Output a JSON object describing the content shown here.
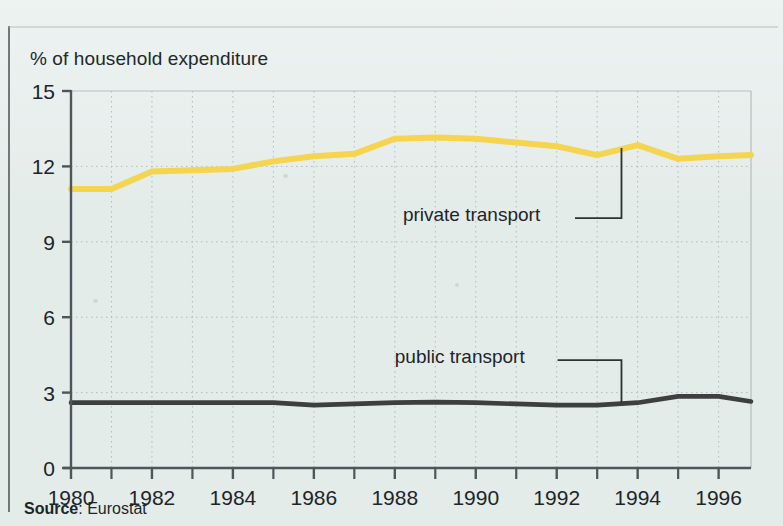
{
  "figure": {
    "axis_title": "% of household expenditure",
    "source_label": "Source",
    "source_separator": ": ",
    "source_value": "Eurostat"
  },
  "annotations": {
    "private": "private transport",
    "public": "public transport"
  },
  "colors": {
    "private_line": "#f5d44f",
    "public_line": "#3b3f40",
    "background": "#e4ecea",
    "axis": "#4d5658",
    "grid": "#aebbb9",
    "text": "#1d2528"
  },
  "chart_data": {
    "type": "line",
    "title": "",
    "subtitle": "",
    "xlabel": "",
    "ylabel": "% of household expenditure",
    "ylim": [
      0,
      15
    ],
    "xlim": [
      1980,
      1996.8
    ],
    "yticks": [
      "0",
      "3",
      "6",
      "9",
      "12",
      "15"
    ],
    "ytick_values": [
      0,
      3,
      6,
      9,
      12,
      15
    ],
    "xticks": [
      "1980",
      "1982",
      "1984",
      "1986",
      "1988",
      "1990",
      "1992",
      "1994",
      "1996"
    ],
    "xtick_values": [
      1980,
      1982,
      1984,
      1986,
      1988,
      1990,
      1992,
      1994,
      1996
    ],
    "minor_xticks": [
      1981,
      1983,
      1985,
      1987,
      1989,
      1991,
      1993,
      1995
    ],
    "grid": "dotted vertical at every year, dotted horizontal at 3/6/9/12/15",
    "legend": "inline annotations with leader lines",
    "legend_position": "inside-plot",
    "x": [
      1980,
      1981,
      1982,
      1983,
      1984,
      1985,
      1986,
      1987,
      1988,
      1989,
      1990,
      1991,
      1992,
      1993,
      1994,
      1995,
      1996,
      1996.8
    ],
    "series": [
      {
        "name": "private transport",
        "color": "#f5d44f",
        "values": [
          11.1,
          11.1,
          11.8,
          11.85,
          11.9,
          12.2,
          12.4,
          12.5,
          13.1,
          13.15,
          13.1,
          12.95,
          12.8,
          12.45,
          12.85,
          12.3,
          12.4,
          12.45
        ]
      },
      {
        "name": "public transport",
        "color": "#3b3f40",
        "values": [
          2.6,
          2.6,
          2.6,
          2.6,
          2.6,
          2.6,
          2.5,
          2.55,
          2.6,
          2.62,
          2.6,
          2.55,
          2.5,
          2.5,
          2.6,
          2.85,
          2.85,
          2.65
        ]
      }
    ],
    "annotations": [
      {
        "text": "private transport",
        "target_series": "private transport",
        "target_x": 1993.6,
        "label_x": 1988.2,
        "label_y": 10.1
      },
      {
        "text": "public transport",
        "target_series": "public transport",
        "target_x": 1993.6,
        "label_x": 1988.0,
        "label_y": 4.45
      }
    ]
  }
}
